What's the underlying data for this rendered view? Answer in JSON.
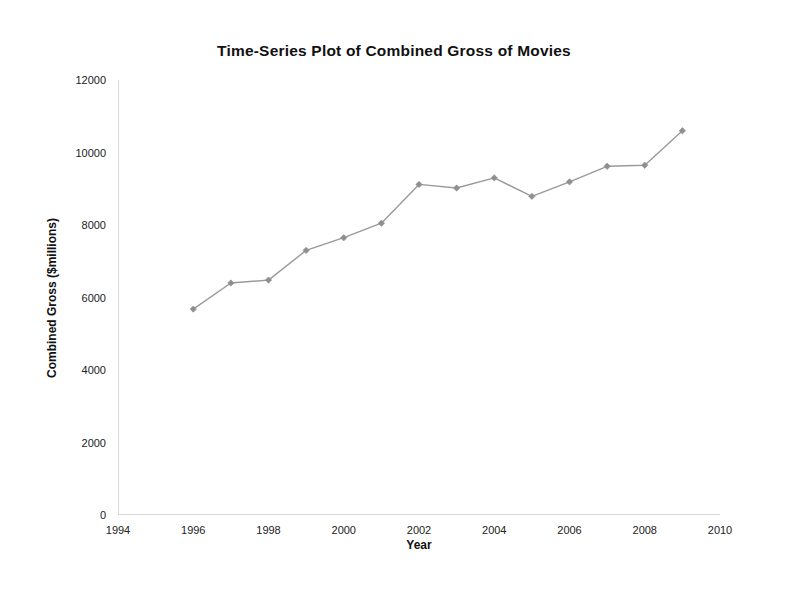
{
  "chart_data": {
    "type": "line",
    "title": "Time-Series Plot of Combined Gross of Movies",
    "xlabel": "Year",
    "ylabel": "Combined Gross ($millions)",
    "x": [
      1996,
      1997,
      1998,
      1999,
      2000,
      2001,
      2002,
      2003,
      2004,
      2005,
      2006,
      2007,
      2008,
      2009
    ],
    "values": [
      5680,
      6400,
      6480,
      7300,
      7650,
      8050,
      9120,
      9020,
      9300,
      8790,
      9190,
      9620,
      9650,
      10600
    ],
    "series": [
      {
        "name": "Combined Gross",
        "values": [
          5680,
          6400,
          6480,
          7300,
          7650,
          8050,
          9120,
          9020,
          9300,
          8790,
          9190,
          9620,
          9650,
          10600
        ]
      }
    ],
    "xlim": [
      1994,
      2010
    ],
    "ylim": [
      0,
      12000
    ],
    "x_ticks": [
      1994,
      1996,
      1998,
      2000,
      2002,
      2004,
      2006,
      2008,
      2010
    ],
    "y_ticks": [
      0,
      2000,
      4000,
      6000,
      8000,
      10000,
      12000
    ],
    "x_tick_labels": [
      "1994",
      "1996",
      "1998",
      "2000",
      "2002",
      "2004",
      "2006",
      "2008",
      "2010"
    ],
    "y_tick_labels": [
      "0",
      "2000",
      "4000",
      "6000",
      "8000",
      "10000",
      "12000"
    ],
    "grid": false,
    "legend": false,
    "legend_position": "none",
    "line_color": "#9a9a9a",
    "marker_color": "#8f8f8f",
    "marker_shape": "diamond",
    "axis_color": "#b4b4b4",
    "background_color": "#ffffff"
  }
}
